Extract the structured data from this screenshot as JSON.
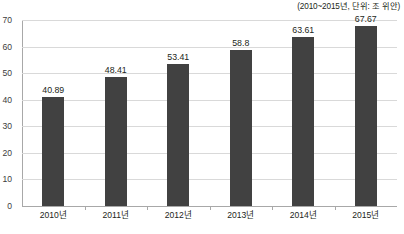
{
  "caption": {
    "unit_note": "(2010~2015년, 단위: 조 위안)"
  },
  "footer": {
    "source_text": ""
  },
  "chart_data": {
    "type": "bar",
    "title": "",
    "subtitle": "(2010~2015년, 단위: 조 위안)",
    "xlabel": "",
    "ylabel": "",
    "categories": [
      "2010년",
      "2011년",
      "2012년",
      "2013년",
      "2014년",
      "2015년"
    ],
    "values": [
      40.89,
      48.41,
      53.41,
      58.8,
      63.61,
      67.67
    ],
    "value_labels": [
      "40.89",
      "48.41",
      "53.41",
      "58.8",
      "63.61",
      "67.67"
    ],
    "ylim": [
      0,
      70
    ],
    "yticks": [
      0,
      10,
      20,
      30,
      40,
      50,
      60,
      70
    ],
    "ytick_labels": [
      "0",
      "10",
      "20",
      "30",
      "40",
      "50",
      "60",
      "70"
    ],
    "grid": true,
    "grid_axis": "y",
    "legend": false,
    "bar_color": "#414141",
    "gridline_color": "#d9d9d9",
    "axis_color": "#a8a8a8",
    "text_color": "#231f20"
  }
}
